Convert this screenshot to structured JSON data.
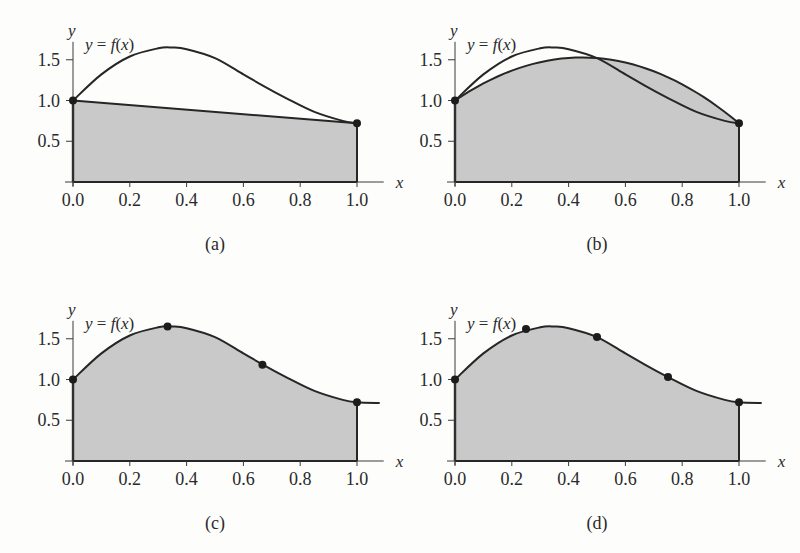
{
  "figure": {
    "colors": {
      "fill": "#c9c9c9",
      "curve": "#262626",
      "axis": "#3a3a3a",
      "background": "#fdfdfc"
    }
  },
  "chart_data": [
    {
      "type": "line",
      "panel": "(a)",
      "function_label": "y = f(x)",
      "xlabel": "x",
      "ylabel": "y",
      "xlim": [
        0,
        1.05
      ],
      "ylim": [
        0,
        1.7
      ],
      "x_ticks": [
        "0.0",
        "0.2",
        "0.4",
        "0.6",
        "0.8",
        "1.0"
      ],
      "y_ticks": [
        "0.5",
        "1.0",
        "1.5"
      ],
      "curve": {
        "x": [
          0,
          0.1,
          0.2,
          0.3,
          0.35,
          0.4,
          0.5,
          0.6,
          0.67,
          0.75,
          0.85,
          0.95,
          1.0
        ],
        "y": [
          1.0,
          1.32,
          1.54,
          1.64,
          1.65,
          1.63,
          1.52,
          1.32,
          1.18,
          1.03,
          0.86,
          0.75,
          0.72
        ]
      },
      "approximation": {
        "kind": "trapezoid (straight line)",
        "x": [
          0,
          1.0
        ],
        "y": [
          1.0,
          0.72
        ]
      },
      "nodes": {
        "x": [
          0,
          1.0
        ],
        "y": [
          1.0,
          0.72
        ]
      },
      "shaded": "area under straight line from x=0 to x=1"
    },
    {
      "type": "line",
      "panel": "(b)",
      "function_label": "y = f(x)",
      "xlabel": "x",
      "ylabel": "y",
      "xlim": [
        0,
        1.05
      ],
      "ylim": [
        0,
        1.7
      ],
      "x_ticks": [
        "0.0",
        "0.2",
        "0.4",
        "0.6",
        "0.8",
        "1.0"
      ],
      "y_ticks": [
        "0.5",
        "1.0",
        "1.5"
      ],
      "curve": {
        "x": [
          0,
          0.1,
          0.2,
          0.3,
          0.35,
          0.4,
          0.5,
          0.6,
          0.67,
          0.75,
          0.85,
          0.95,
          1.0
        ],
        "y": [
          1.0,
          1.32,
          1.54,
          1.64,
          1.65,
          1.63,
          1.52,
          1.32,
          1.18,
          1.03,
          0.86,
          0.75,
          0.72
        ]
      },
      "approximation": {
        "kind": "quadratic (Simpson)",
        "coefficients": [
          1.0,
          2.36,
          -2.64
        ],
        "x": [
          0,
          0.25,
          0.447,
          0.5,
          0.75,
          1.0
        ],
        "y": [
          1.0,
          1.42,
          1.53,
          1.52,
          1.29,
          0.72
        ]
      },
      "nodes": {
        "x": [
          0,
          1.0
        ],
        "y": [
          1.0,
          0.72
        ]
      },
      "shaded": "area under parabola from x=0 to x=1"
    },
    {
      "type": "area",
      "panel": "(c)",
      "function_label": "y = f(x)",
      "xlabel": "x",
      "ylabel": "y",
      "xlim": [
        0,
        1.08
      ],
      "ylim": [
        0,
        1.7
      ],
      "x_ticks": [
        "0.0",
        "0.2",
        "0.4",
        "0.6",
        "0.8",
        "1.0"
      ],
      "y_ticks": [
        "0.5",
        "1.0",
        "1.5"
      ],
      "curve": {
        "x": [
          0,
          0.1,
          0.2,
          0.3,
          0.35,
          0.4,
          0.5,
          0.6,
          0.67,
          0.75,
          0.85,
          0.95,
          1.0,
          1.08
        ],
        "y": [
          1.0,
          1.32,
          1.54,
          1.64,
          1.65,
          1.63,
          1.52,
          1.32,
          1.18,
          1.03,
          0.86,
          0.75,
          0.72,
          0.71
        ]
      },
      "nodes": {
        "x": [
          0,
          0.333,
          0.667,
          1.0
        ],
        "y": [
          1.0,
          1.65,
          1.18,
          0.72
        ]
      },
      "shaded": "area under curve from x=0 to x=1"
    },
    {
      "type": "area",
      "panel": "(d)",
      "function_label": "y = f(x)",
      "xlabel": "x",
      "ylabel": "y",
      "xlim": [
        0,
        1.08
      ],
      "ylim": [
        0,
        1.7
      ],
      "x_ticks": [
        "0.0",
        "0.2",
        "0.4",
        "0.6",
        "0.8",
        "1.0"
      ],
      "y_ticks": [
        "0.5",
        "1.0",
        "1.5"
      ],
      "curve": {
        "x": [
          0,
          0.1,
          0.2,
          0.3,
          0.35,
          0.4,
          0.5,
          0.6,
          0.67,
          0.75,
          0.85,
          0.95,
          1.0,
          1.08
        ],
        "y": [
          1.0,
          1.32,
          1.54,
          1.64,
          1.65,
          1.63,
          1.52,
          1.32,
          1.18,
          1.03,
          0.86,
          0.75,
          0.72,
          0.71
        ]
      },
      "nodes": {
        "x": [
          0,
          0.25,
          0.5,
          0.75,
          1.0
        ],
        "y": [
          1.0,
          1.62,
          1.52,
          1.03,
          0.72
        ]
      },
      "shaded": "area under curve from x=0 to x=1"
    }
  ],
  "panels": [
    {
      "caption": "(a)",
      "function_label": "y = f(x)",
      "xvar": "x",
      "yvar": "y"
    },
    {
      "caption": "(b)",
      "function_label": "y = f(x)",
      "xvar": "x",
      "yvar": "y"
    },
    {
      "caption": "(c)",
      "function_label": "y = f(x)",
      "xvar": "x",
      "yvar": "y"
    },
    {
      "caption": "(d)",
      "function_label": "y = f(x)",
      "xvar": "x",
      "yvar": "y"
    }
  ]
}
